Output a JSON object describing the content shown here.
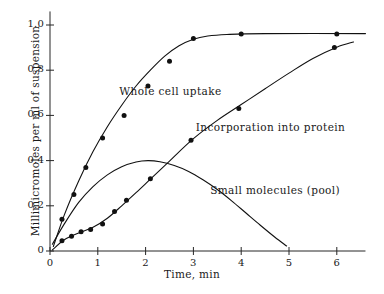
{
  "chart_data": {
    "type": "line",
    "title": "",
    "xlabel": "Time, min",
    "ylabel": "Millimicromoles per ml of suspension",
    "xlim": [
      0,
      6.6
    ],
    "ylim": [
      0,
      1.06
    ],
    "xticks": [
      "0",
      "1",
      "2",
      "3",
      "4",
      "5",
      "6"
    ],
    "xtick_values": [
      0,
      1,
      2,
      3,
      4,
      5,
      6
    ],
    "yticks": [
      "0",
      "0.2",
      "0.4",
      "0.6",
      "0.8",
      "1.0"
    ],
    "ytick_values": [
      0,
      0.2,
      0.4,
      0.6,
      0.8,
      1.0
    ],
    "grid": false,
    "legend": "inline annotations",
    "marker": "filled-circle",
    "line_color": "#111111",
    "series": [
      {
        "name": "Whole cell uptake",
        "annotation": "Whole cell uptake",
        "annotation_xy": [
          1.45,
          0.705
        ],
        "has_markers": true,
        "x": [
          0.25,
          0.5,
          0.75,
          1.1,
          1.55,
          2.05,
          2.5,
          3.0,
          4.0,
          6.0
        ],
        "y": [
          0.14,
          0.25,
          0.37,
          0.5,
          0.6,
          0.73,
          0.84,
          0.94,
          0.96,
          0.96
        ],
        "curve": [
          [
            0.07,
            0.02
          ],
          [
            0.3,
            0.16
          ],
          [
            0.6,
            0.31
          ],
          [
            0.9,
            0.44
          ],
          [
            1.2,
            0.55
          ],
          [
            1.5,
            0.645
          ],
          [
            1.8,
            0.73
          ],
          [
            2.1,
            0.8
          ],
          [
            2.4,
            0.862
          ],
          [
            2.7,
            0.908
          ],
          [
            3.0,
            0.937
          ],
          [
            3.3,
            0.951
          ],
          [
            3.7,
            0.958
          ],
          [
            4.5,
            0.962
          ],
          [
            6.6,
            0.962
          ]
        ]
      },
      {
        "name": "Incorporation into protein",
        "annotation": "Incorporation into protein",
        "annotation_xy": [
          3.05,
          0.545
        ],
        "has_markers": true,
        "x": [
          0.25,
          0.45,
          0.65,
          0.85,
          1.1,
          1.35,
          1.6,
          2.1,
          2.95,
          3.95,
          5.95
        ],
        "y": [
          0.045,
          0.065,
          0.085,
          0.095,
          0.12,
          0.175,
          0.225,
          0.32,
          0.49,
          0.63,
          0.9
        ],
        "curve": [
          [
            0.05,
            0.005
          ],
          [
            0.3,
            0.05
          ],
          [
            0.6,
            0.08
          ],
          [
            0.9,
            0.105
          ],
          [
            1.2,
            0.145
          ],
          [
            1.5,
            0.2
          ],
          [
            1.8,
            0.258
          ],
          [
            2.1,
            0.318
          ],
          [
            2.5,
            0.398
          ],
          [
            3.0,
            0.497
          ],
          [
            3.5,
            0.578
          ],
          [
            4.0,
            0.648
          ],
          [
            4.5,
            0.718
          ],
          [
            5.0,
            0.787
          ],
          [
            5.5,
            0.852
          ],
          [
            6.0,
            0.902
          ],
          [
            6.35,
            0.925
          ]
        ]
      },
      {
        "name": "Small molecules (pool)",
        "annotation": "Small molecules (pool)",
        "annotation_xy": [
          3.35,
          0.265
        ],
        "has_markers": false,
        "peak": [
          2.05,
          0.4
        ],
        "curve": [
          [
            0.05,
            0.03
          ],
          [
            0.3,
            0.12
          ],
          [
            0.6,
            0.215
          ],
          [
            0.9,
            0.285
          ],
          [
            1.2,
            0.337
          ],
          [
            1.5,
            0.373
          ],
          [
            1.8,
            0.394
          ],
          [
            2.05,
            0.4
          ],
          [
            2.3,
            0.395
          ],
          [
            2.6,
            0.378
          ],
          [
            2.9,
            0.352
          ],
          [
            3.2,
            0.315
          ],
          [
            3.5,
            0.272
          ],
          [
            3.8,
            0.222
          ],
          [
            4.1,
            0.168
          ],
          [
            4.4,
            0.114
          ],
          [
            4.7,
            0.062
          ],
          [
            4.95,
            0.022
          ]
        ]
      }
    ]
  }
}
